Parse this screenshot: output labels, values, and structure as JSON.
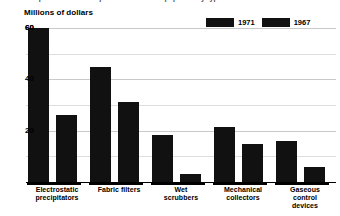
{
  "cropped_header_text": "the expenditures on air pollution control equipment by type",
  "legend": {
    "position": "top-right",
    "items": [
      {
        "label": "1971",
        "color": "#111111"
      },
      {
        "label": "1967",
        "color": "#111111"
      }
    ]
  },
  "axis": {
    "ylabel": "Millions of dollars",
    "ticks": [
      "60",
      "40",
      "20"
    ]
  },
  "chart_data": {
    "type": "bar",
    "title": "",
    "subtitle": "",
    "xlabel": "",
    "ylabel": "Millions of dollars",
    "ylim": [
      0,
      60
    ],
    "ytick_values": [
      20,
      40,
      60
    ],
    "minor_gridline_values": [
      10,
      30,
      50
    ],
    "grid": true,
    "legend_position": "top-right",
    "categories": [
      "Electrostatic precipitators",
      "Fabric filters",
      "Wet scrubbers",
      "Mechanical collectors",
      "Gaseous control devices"
    ],
    "category_lines": [
      [
        "Electrostatic",
        "precipitators"
      ],
      [
        "Fabric filters"
      ],
      [
        "Wet",
        "scrubbers"
      ],
      [
        "Mechanical",
        "collectors"
      ],
      [
        "Gaseous",
        "control",
        "devices"
      ]
    ],
    "series": [
      {
        "name": "1971",
        "color": "#111111",
        "values": [
          60,
          45,
          18.5,
          21.5,
          16
        ]
      },
      {
        "name": "1967",
        "color": "#111111",
        "values": [
          26,
          31,
          3,
          15,
          6
        ]
      }
    ]
  }
}
